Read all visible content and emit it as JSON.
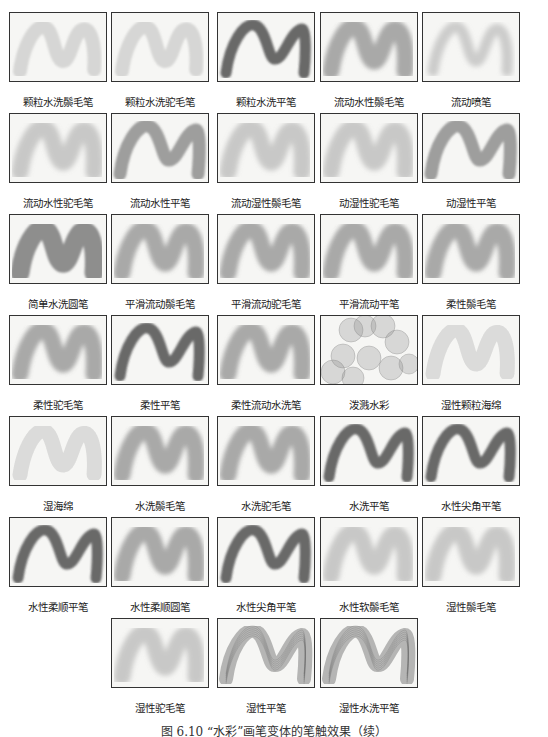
{
  "figure": {
    "caption": "图 6.10 “水彩”画笔变体的笔触效果（续）",
    "rows": [
      {
        "top": 12,
        "cells": [
          {
            "label": "颗粒水洗鬃毛笔",
            "style": "grainy-light",
            "x": 9
          },
          {
            "label": "颗粒水洗驼毛笔",
            "style": "grainy-light",
            "x": 111
          },
          {
            "label": "颗粒水洗平笔",
            "style": "flat-dark",
            "x": 217
          },
          {
            "label": "流动水性鬃毛笔",
            "style": "soft-medium",
            "x": 320
          },
          {
            "label": "流动喷笔",
            "style": "airbrush-light",
            "x": 422
          }
        ]
      },
      {
        "top": 113,
        "cells": [
          {
            "label": "流动水性驼毛笔",
            "style": "soft-light",
            "x": 9
          },
          {
            "label": "流动水性平笔",
            "style": "flat-medium",
            "x": 111
          },
          {
            "label": "流动湿性鬃毛笔",
            "style": "soft-light",
            "x": 217
          },
          {
            "label": "动湿性驼毛笔",
            "style": "soft-light",
            "x": 320
          },
          {
            "label": "动湿性平笔",
            "style": "flat-medium",
            "x": 422
          }
        ]
      },
      {
        "top": 214,
        "cells": [
          {
            "label": "简单水洗圆笔",
            "style": "round-solid",
            "x": 9
          },
          {
            "label": "平滑流动鬃毛笔",
            "style": "soft-medium",
            "x": 111
          },
          {
            "label": "平滑流动驼毛笔",
            "style": "soft-medium",
            "x": 217
          },
          {
            "label": "平滑流动平笔",
            "style": "soft-medium",
            "x": 320
          },
          {
            "label": "柔性鬃毛笔",
            "style": "soft-medium",
            "x": 422
          }
        ]
      },
      {
        "top": 315,
        "cells": [
          {
            "label": "柔性驼毛笔",
            "style": "soft-medium",
            "x": 9
          },
          {
            "label": "柔性平笔",
            "style": "flat-dark",
            "x": 111
          },
          {
            "label": "柔性流动水洗笔",
            "style": "soft-medium",
            "x": 217
          },
          {
            "label": "泼溅水彩",
            "style": "splash",
            "x": 320
          },
          {
            "label": "湿性颗粒海绵",
            "style": "sponge",
            "x": 422
          }
        ]
      },
      {
        "top": 416,
        "cells": [
          {
            "label": "湿海绵",
            "style": "sponge",
            "x": 9
          },
          {
            "label": "水洗鬃毛笔",
            "style": "soft-medium",
            "x": 111
          },
          {
            "label": "水洗驼毛笔",
            "style": "soft-medium",
            "x": 217
          },
          {
            "label": "水洗平笔",
            "style": "flat-dark",
            "x": 320
          },
          {
            "label": "水性尖角平笔",
            "style": "flat-dark",
            "x": 422
          }
        ]
      },
      {
        "top": 517,
        "cells": [
          {
            "label": "水性柔顺平笔",
            "style": "flat-dark",
            "x": 9
          },
          {
            "label": "水性柔顺圆笔",
            "style": "soft-medium",
            "x": 111
          },
          {
            "label": "水性尖角平笔",
            "style": "flat-dark",
            "x": 217
          },
          {
            "label": "水性软鬃毛笔",
            "style": "soft-light",
            "x": 320
          },
          {
            "label": "湿性鬃毛笔",
            "style": "soft-light",
            "x": 422
          }
        ]
      },
      {
        "top": 618,
        "cells": [
          {
            "label": "湿性驼毛笔",
            "style": "soft-light",
            "x": 111
          },
          {
            "label": "湿性平笔",
            "style": "flat-lined",
            "x": 217
          },
          {
            "label": "湿性水洗平笔",
            "style": "flat-lined",
            "x": 320
          }
        ]
      }
    ]
  }
}
